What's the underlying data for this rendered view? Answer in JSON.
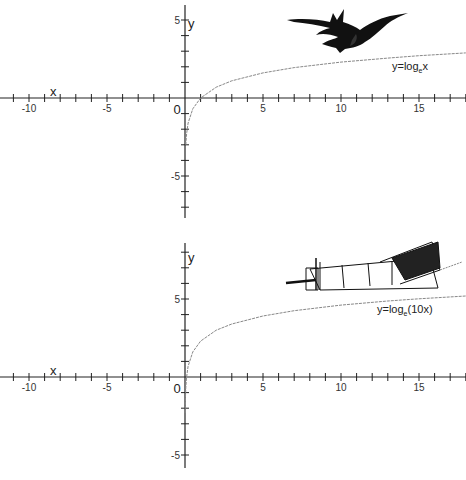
{
  "chart_data": [
    {
      "type": "line",
      "title": "",
      "xlabel": "x",
      "ylabel": "y",
      "xlim": [
        -12,
        18
      ],
      "ylim": [
        -7.5,
        5.5
      ],
      "x_ticks": [
        -10,
        -5,
        0,
        5,
        10,
        15
      ],
      "x_tick_labels": [
        "-10",
        "-5",
        "0",
        "5",
        "10",
        "15"
      ],
      "y_ticks": [
        -5,
        5
      ],
      "y_tick_labels": [
        "-5",
        "5"
      ],
      "grid": false,
      "series": [
        {
          "name": "y=log_e x",
          "label_main": "y=log",
          "label_sub": "e",
          "label_tail": "x",
          "x": [
            0.05,
            0.1,
            0.2,
            0.5,
            1,
            2,
            3,
            5,
            7,
            10,
            13,
            15,
            18
          ],
          "values": [
            -3.0,
            -2.3,
            -1.61,
            -0.69,
            0,
            0.69,
            1.1,
            1.61,
            1.95,
            2.3,
            2.56,
            2.71,
            2.89
          ]
        }
      ],
      "decoration": "bat-illustration"
    },
    {
      "type": "line",
      "title": "",
      "xlabel": "x",
      "ylabel": "y",
      "xlim": [
        -12,
        18
      ],
      "ylim": [
        -5.5,
        8.5
      ],
      "x_ticks": [
        -10,
        -5,
        0,
        5,
        10,
        15
      ],
      "x_tick_labels": [
        "-10",
        "-5",
        "0",
        "5",
        "10",
        "15"
      ],
      "y_ticks": [
        -5,
        5
      ],
      "y_tick_labels": [
        "-5",
        "5"
      ],
      "grid": false,
      "series": [
        {
          "name": "y=log_e(10x)",
          "label_main": "y=log",
          "label_sub": "e",
          "label_tail": "(10x)",
          "x": [
            0.01,
            0.02,
            0.05,
            0.1,
            0.2,
            0.5,
            1,
            2,
            3,
            5,
            7,
            10,
            13,
            15,
            18
          ],
          "values": [
            -2.3,
            -1.61,
            -0.69,
            0,
            0.69,
            1.61,
            2.3,
            3.0,
            3.4,
            3.91,
            4.25,
            4.61,
            4.87,
            5.01,
            5.19
          ]
        }
      ],
      "decoration": "biplane-illustration"
    }
  ]
}
